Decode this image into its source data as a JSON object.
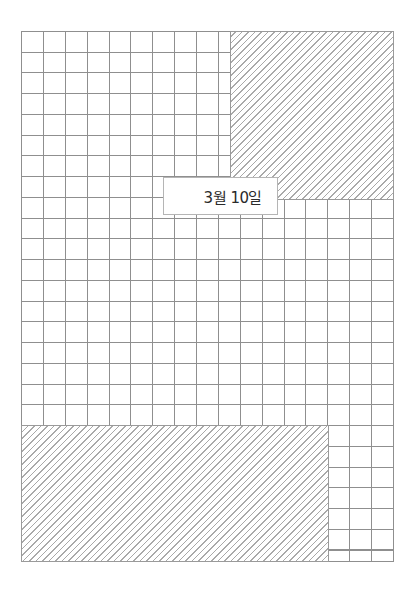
{
  "page": {
    "type": "grid-paper-sheet",
    "grid": {
      "columns": 17,
      "rows": 25,
      "line_color": "#8f8f8f",
      "background": "#ffffff"
    },
    "hatched_regions": [
      {
        "name": "top-right-block",
        "color": "#a9a9a9"
      },
      {
        "name": "bottom-left-block",
        "color": "#a9a9a9"
      }
    ],
    "date_label": {
      "text": "3월 10일"
    }
  }
}
